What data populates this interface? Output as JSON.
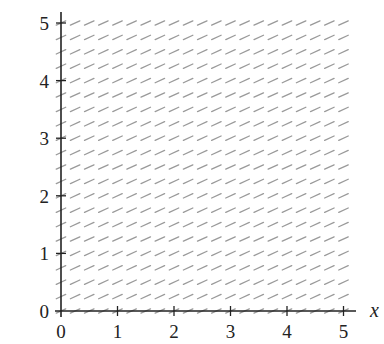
{
  "chart_data": {
    "type": "slope_field",
    "title": "",
    "xlabel": "x",
    "ylabel": "",
    "xlim": [
      0,
      5
    ],
    "ylim": [
      0,
      5
    ],
    "x_ticks": [
      0,
      1,
      2,
      3,
      4,
      5
    ],
    "y_ticks": [
      0,
      1,
      2,
      3,
      4,
      5
    ],
    "x_tick_labels": [
      "0",
      "1",
      "2",
      "3",
      "4",
      "5"
    ],
    "y_tick_labels": [
      "0",
      "1",
      "2",
      "3",
      "4",
      "5"
    ],
    "grid": false,
    "field": {
      "description": "Uniform slope field: every segment has the same slope",
      "slope": 0.45,
      "x_start": 0,
      "x_end": 5,
      "x_step": 0.25,
      "y_start": 0,
      "y_end": 5,
      "y_step": 0.25,
      "segment_color": "#9a9a9a"
    }
  },
  "layout": {
    "origin_px": [
      61,
      311
    ],
    "px_per_unit_x": 56.5,
    "px_per_unit_y": 57.6,
    "x_axis_end_px": 356,
    "y_axis_top_px": 12,
    "segment_half_length_px": 5.2,
    "axis_color": "#222222"
  }
}
